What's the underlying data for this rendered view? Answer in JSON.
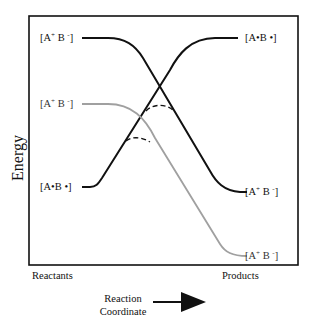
{
  "diagram": {
    "y_axis_label": "Energy",
    "x_axis_start_label": "Reactants",
    "x_axis_end_label": "Products",
    "x_axis_caption_line1": "Reaction",
    "x_axis_caption_line2": "Coordinate",
    "x_axis_arrow": "right-arrow",
    "left_states": [
      {
        "label_main": "[A",
        "sup": "+",
        "label_mid": " B ",
        "sup2": "-",
        "label_end": "]",
        "curve": "black",
        "level": "high"
      },
      {
        "label_main": "[A",
        "sup": "+",
        "label_mid": " B ",
        "sup2": "-",
        "label_end": "]",
        "curve": "gray",
        "level": "middle"
      },
      {
        "label_text": "[A•B •]",
        "curve": "black",
        "level": "low"
      }
    ],
    "right_states": [
      {
        "label_text": "[A•B •]",
        "curve": "black",
        "level": "high"
      },
      {
        "label_main": "[A",
        "sup": "+",
        "label_mid": " B ",
        "sup2": "-",
        "label_end": "]",
        "curve": "black",
        "level": "middle"
      },
      {
        "label_main": "[A",
        "sup": "+",
        "label_mid": " B ",
        "sup2": "-",
        "label_end": "]",
        "curve": "gray",
        "level": "low"
      }
    ],
    "colors": {
      "curve_black": "#111111",
      "curve_gray": "#a0a0a0",
      "frame": "#111111"
    },
    "annotations": [
      "dashed avoided-crossing arc upper",
      "dashed avoided-crossing arc lower"
    ]
  }
}
